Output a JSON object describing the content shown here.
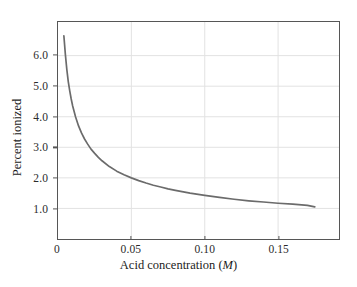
{
  "chart_data": {
    "type": "line",
    "title": "",
    "xlabel": "Acid concentration (M)",
    "xlabel_main": "Acid concentration (",
    "xlabel_italic": "M",
    "xlabel_tail": ")",
    "ylabel": "Percent ionized",
    "xlim": [
      0,
      0.1915
    ],
    "ylim": [
      0,
      7.1
    ],
    "xticks": [
      0,
      0.05,
      0.1,
      0.15
    ],
    "xtick_labels": [
      "0",
      "0.05",
      "0.10",
      "0.15"
    ],
    "yticks": [
      1.0,
      2.0,
      3.0,
      4.0,
      5.0,
      6.0
    ],
    "ytick_labels": [
      "1.0",
      "2.0",
      "3.0",
      "4.0",
      "5.0",
      "6.0"
    ],
    "grid": "both-at-ticks",
    "legend": "none",
    "series": [
      {
        "name": "Percent ionized vs acid concentration",
        "color": "#6b6b6b",
        "x": [
          0.004,
          0.0045,
          0.005,
          0.006,
          0.007,
          0.008,
          0.009,
          0.01,
          0.012,
          0.014,
          0.016,
          0.018,
          0.02,
          0.0225,
          0.025,
          0.0275,
          0.03,
          0.035,
          0.04,
          0.045,
          0.05,
          0.055,
          0.06,
          0.065,
          0.07,
          0.075,
          0.08,
          0.09,
          0.1,
          0.11,
          0.12,
          0.13,
          0.14,
          0.15,
          0.16,
          0.17,
          0.175
        ],
        "y": [
          6.65,
          6.35,
          6.05,
          5.55,
          5.15,
          4.85,
          4.58,
          4.35,
          3.99,
          3.7,
          3.47,
          3.28,
          3.12,
          2.94,
          2.8,
          2.67,
          2.56,
          2.37,
          2.22,
          2.1,
          2.0,
          1.91,
          1.83,
          1.76,
          1.7,
          1.64,
          1.59,
          1.5,
          1.43,
          1.36,
          1.3,
          1.25,
          1.21,
          1.17,
          1.14,
          1.1,
          1.05
        ]
      }
    ],
    "annotations": []
  },
  "axis_style": {
    "frame_color": "#565656",
    "grid_color": "#e2e2e2",
    "tick_color": "#565656",
    "text_color": "#1c1c1c",
    "background": "#ffffff"
  }
}
